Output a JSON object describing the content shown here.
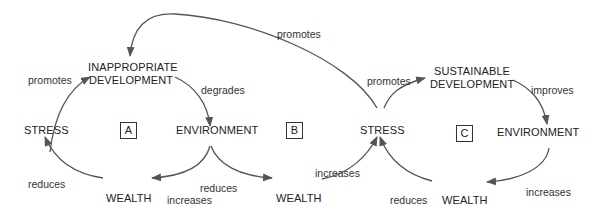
{
  "diagram": {
    "loops": [
      {
        "id": "A",
        "label": "A"
      },
      {
        "id": "B",
        "label": "B"
      },
      {
        "id": "C",
        "label": "C"
      }
    ],
    "nodes": {
      "inappropriate_development_line1": "INAPPROPRIATE",
      "inappropriate_development_line2": "DEVELOPMENT",
      "sustainable_development_line1": "SUSTAINABLE",
      "sustainable_development_line2": "DEVELOPMENT",
      "stress_a": "STRESS",
      "environment_a": "ENVIRONMENT",
      "wealth_a": "WEALTH",
      "wealth_b": "WEALTH",
      "stress_b": "STRESS",
      "environment_c": "ENVIRONMENT",
      "wealth_c": "WEALTH"
    },
    "edge_labels": {
      "stress_to_inappropriate": "promotes",
      "inappropriate_to_environment": "degrades",
      "environment_to_wealth_a": "increases",
      "environment_to_wealth_b": "reduces",
      "wealth_to_stress_a": "reduces",
      "wealth_b_to_stress_b": "increases",
      "stress_b_to_inappropriate": "promotes",
      "stress_b_to_sustainable": "promotes",
      "sustainable_to_environment": "improves",
      "environment_c_to_wealth_c": "increases",
      "wealth_c_to_stress_b": "reduces"
    },
    "colors": {
      "line": "#555555",
      "text": "#222222"
    }
  }
}
